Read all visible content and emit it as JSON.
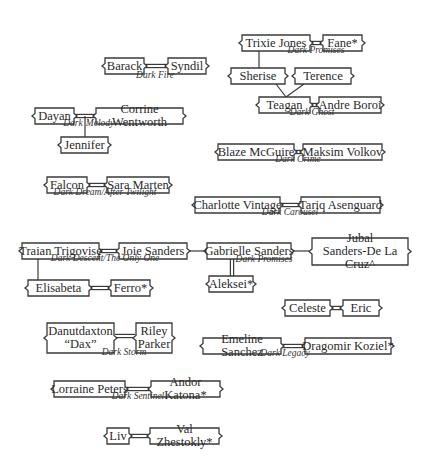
{
  "nodes": [
    {
      "id": "barack",
      "label": "Barack",
      "x": 102,
      "y": 58,
      "w": 45,
      "h": 16
    },
    {
      "id": "syndil",
      "label": "Syndil",
      "x": 165,
      "y": 58,
      "w": 44,
      "h": 16
    },
    {
      "id": "trixie",
      "label": "Trixie Jones",
      "x": 239,
      "y": 35,
      "w": 74,
      "h": 16
    },
    {
      "id": "fane",
      "label": "Fane*",
      "x": 320,
      "y": 35,
      "w": 45,
      "h": 16
    },
    {
      "id": "sherise",
      "label": "Sherise",
      "x": 228,
      "y": 68,
      "w": 60,
      "h": 16
    },
    {
      "id": "terence",
      "label": "Terence",
      "x": 292,
      "y": 68,
      "w": 62,
      "h": 16
    },
    {
      "id": "teagan",
      "label": "Teagan",
      "x": 256,
      "y": 97,
      "w": 57,
      "h": 16
    },
    {
      "id": "andre",
      "label": "Andre Boroi",
      "x": 316,
      "y": 97,
      "w": 68,
      "h": 16
    },
    {
      "id": "dayan",
      "label": "Dayan",
      "x": 32,
      "y": 108,
      "w": 45,
      "h": 16
    },
    {
      "id": "corrine",
      "label": "Corrine Wentworth",
      "x": 93,
      "y": 108,
      "w": 93,
      "h": 16
    },
    {
      "id": "jennifer",
      "label": "Jennifer",
      "x": 58,
      "y": 137,
      "w": 53,
      "h": 16
    },
    {
      "id": "blaze",
      "label": "Blaze McGuire",
      "x": 215,
      "y": 144,
      "w": 82,
      "h": 16
    },
    {
      "id": "maksim",
      "label": "Maksim Volkov",
      "x": 300,
      "y": 144,
      "w": 85,
      "h": 16
    },
    {
      "id": "falcon",
      "label": "Falcon",
      "x": 44,
      "y": 177,
      "w": 46,
      "h": 16
    },
    {
      "id": "sara",
      "label": "Sara Marten",
      "x": 104,
      "y": 177,
      "w": 68,
      "h": 16
    },
    {
      "id": "charlotte",
      "label": "Charlotte Vintage",
      "x": 192,
      "y": 197,
      "w": 91,
      "h": 16
    },
    {
      "id": "tariq",
      "label": "Tariq Asenguard",
      "x": 298,
      "y": 197,
      "w": 85,
      "h": 16
    },
    {
      "id": "traian",
      "label": "Traian Trigovise",
      "x": 19,
      "y": 243,
      "w": 83,
      "h": 16
    },
    {
      "id": "joie",
      "label": "Joie Sanders",
      "x": 116,
      "y": 243,
      "w": 74,
      "h": 16
    },
    {
      "id": "gabrielle",
      "label": "Gabrielle Sanders",
      "x": 204,
      "y": 243,
      "w": 90,
      "h": 16
    },
    {
      "id": "jubal",
      "label": "Jubal\nSanders-De La Cruz^",
      "x": 309,
      "y": 238,
      "w": 102,
      "h": 27
    },
    {
      "id": "elisabeta",
      "label": "Elisabeta",
      "x": 25,
      "y": 280,
      "w": 67,
      "h": 16
    },
    {
      "id": "ferro",
      "label": "Ferro*",
      "x": 108,
      "y": 280,
      "w": 45,
      "h": 16
    },
    {
      "id": "aleksei",
      "label": "Aleksei*",
      "x": 206,
      "y": 276,
      "w": 50,
      "h": 16
    },
    {
      "id": "celeste",
      "label": "Celeste",
      "x": 282,
      "y": 300,
      "w": 51,
      "h": 16
    },
    {
      "id": "eric",
      "label": "Eric",
      "x": 340,
      "y": 300,
      "w": 42,
      "h": 16
    },
    {
      "id": "dax",
      "label": "Danutdaxton\n“Dax”",
      "x": 44,
      "y": 323,
      "w": 73,
      "h": 30
    },
    {
      "id": "riley",
      "label": "Riley\nParker",
      "x": 133,
      "y": 323,
      "w": 42,
      "h": 30
    },
    {
      "id": "emeline",
      "label": "Emeline Sanchez",
      "x": 200,
      "y": 338,
      "w": 84,
      "h": 16
    },
    {
      "id": "dragomir",
      "label": "Dragomir Koziel*",
      "x": 302,
      "y": 338,
      "w": 92,
      "h": 16
    },
    {
      "id": "lorraine",
      "label": "Lorraine Peters",
      "x": 51,
      "y": 381,
      "w": 77,
      "h": 16
    },
    {
      "id": "andor",
      "label": "Andor Katona*",
      "x": 148,
      "y": 381,
      "w": 75,
      "h": 16
    },
    {
      "id": "liv",
      "label": "Liv",
      "x": 104,
      "y": 428,
      "w": 28,
      "h": 16
    },
    {
      "id": "val",
      "label": "Val Zhestokly*",
      "x": 147,
      "y": 428,
      "w": 75,
      "h": 16
    }
  ],
  "captions": [
    {
      "text": "Dark Fire",
      "x": 155,
      "y": 79
    },
    {
      "text": "Dark Promises",
      "x": 316,
      "y": 54
    },
    {
      "text": "Dark Ghost",
      "x": 312,
      "y": 116
    },
    {
      "text": "Dark",
      "x": 73,
      "y": 127
    },
    {
      "text": "Melody",
      "x": 100,
      "y": 127
    },
    {
      "text": "Dark Crime",
      "x": 298,
      "y": 163
    },
    {
      "text": "Dark Dream/After Twilight",
      "x": 105,
      "y": 196
    },
    {
      "text": "Dark Carousel",
      "x": 290,
      "y": 216
    },
    {
      "text": "Dark Descent/The Only One",
      "x": 105,
      "y": 262
    },
    {
      "text": "Dark Promises",
      "x": 264,
      "y": 263
    },
    {
      "text": "Dark Storm",
      "x": 124,
      "y": 356
    },
    {
      "text": "Dark Legacy",
      "x": 285,
      "y": 357
    },
    {
      "text": "Dark Sentinel",
      "x": 138,
      "y": 400
    }
  ],
  "marriages": [
    {
      "x1": 147,
      "x2": 165,
      "y": 66
    },
    {
      "x1": 313,
      "x2": 320,
      "y": 43
    },
    {
      "x1": 313,
      "x2": 316,
      "y": 105
    },
    {
      "x1": 77,
      "x2": 93,
      "y": 116
    },
    {
      "x1": 297,
      "x2": 300,
      "y": 152
    },
    {
      "x1": 90,
      "x2": 104,
      "y": 185
    },
    {
      "x1": 283,
      "x2": 298,
      "y": 205
    },
    {
      "x1": 102,
      "x2": 116,
      "y": 251
    },
    {
      "x1": 92,
      "x2": 108,
      "y": 288
    },
    {
      "x1": 333,
      "x2": 340,
      "y": 308
    },
    {
      "x1": 117,
      "x2": 133,
      "y": 336
    },
    {
      "x1": 284,
      "x2": 302,
      "y": 346
    },
    {
      "x1": 128,
      "x2": 148,
      "y": 389
    },
    {
      "x1": 132,
      "x2": 147,
      "y": 436
    }
  ],
  "lines": [
    {
      "x1": 259,
      "y1": 51,
      "x2": 259,
      "y2": 68
    },
    {
      "x1": 276,
      "y1": 84,
      "x2": 286,
      "y2": 97
    },
    {
      "x1": 304,
      "y1": 84,
      "x2": 286,
      "y2": 97
    },
    {
      "x1": 85,
      "y1": 116,
      "x2": 85,
      "y2": 137
    },
    {
      "x1": 38,
      "y1": 259,
      "x2": 38,
      "y2": 280
    },
    {
      "x1": 190,
      "y1": 251,
      "x2": 204,
      "y2": 251
    },
    {
      "x1": 294,
      "y1": 251,
      "x2": 309,
      "y2": 251
    }
  ],
  "double_vertical": [
    {
      "x": 232,
      "y1": 259,
      "y2": 276
    }
  ]
}
